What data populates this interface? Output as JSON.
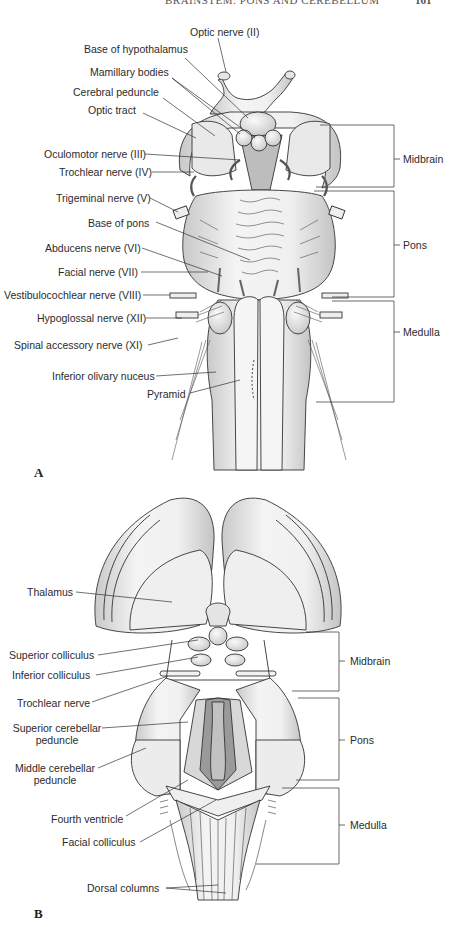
{
  "page": {
    "running_header": "BRAINSTEM: PONS AND CEREBELLUM",
    "page_number": "161"
  },
  "panel_a": {
    "letter": "A",
    "view": "ventral brainstem",
    "labels": [
      "Optic nerve (II)",
      "Base of hypothalamus",
      "Mamillary bodies",
      "Cerebral peduncle",
      "Optic tract",
      "Oculomotor nerve (III)",
      "Trochlear nerve (IV)",
      "Trigeminal nerve (V)",
      "Base of pons",
      "Abducens nerve (VI)",
      "Facial nerve (VII)",
      "Vestibulocochlear nerve (VIII)",
      "Hypoglossal nerve (XII)",
      "Spinal accessory nerve (XI)",
      "Inferior olivary nuceus",
      "Pyramid"
    ],
    "brackets": [
      {
        "label": "Midbrain"
      },
      {
        "label": "Pons"
      },
      {
        "label": "Medulla"
      }
    ]
  },
  "panel_b": {
    "letter": "B",
    "view": "dorsal brainstem",
    "labels": [
      "Thalamus",
      "Superior colliculus",
      "Inferior colliculus",
      "Trochlear nerve",
      "Superior cerebellar",
      "peduncle",
      "Middle cerebellar",
      "peduncle",
      "Fourth ventricle",
      "Facial colliculus",
      "Dorsal columns"
    ],
    "brackets": [
      {
        "label": "Midbrain"
      },
      {
        "label": "Pons"
      },
      {
        "label": "Medulla"
      }
    ]
  },
  "colors": {
    "line": "#333333",
    "fill_light": "#eeeeee",
    "fill_mid": "#d4d4d4",
    "fill_dark": "#a8a8a8",
    "background": "#ffffff"
  }
}
